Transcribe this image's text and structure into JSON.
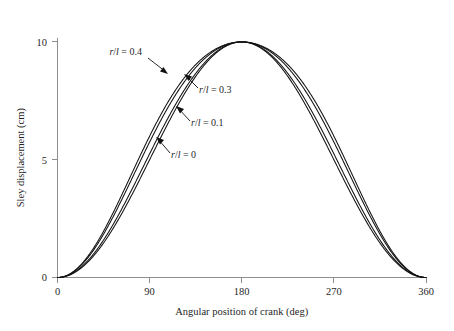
{
  "chart_data": {
    "type": "line",
    "title": "",
    "xlabel": "Angular position of crank (deg)",
    "ylabel": "Sley displacement (cm)",
    "xlim": [
      0,
      360
    ],
    "ylim": [
      0,
      10.6
    ],
    "xticks": [
      0,
      90,
      180,
      270,
      360
    ],
    "xtick_labels": [
      "0",
      "90",
      "180",
      "270",
      "360"
    ],
    "yticks": [
      0,
      5,
      10
    ],
    "ytick_labels": [
      "0",
      "5",
      "10"
    ],
    "grid": false,
    "legend_position": "inline-annotations",
    "x": [
      0,
      10,
      20,
      30,
      40,
      50,
      60,
      70,
      80,
      90,
      100,
      110,
      120,
      130,
      140,
      150,
      160,
      170,
      180,
      190,
      200,
      210,
      220,
      230,
      240,
      250,
      260,
      270,
      280,
      290,
      300,
      310,
      320,
      330,
      340,
      350,
      360
    ],
    "series": [
      {
        "name": "r/l = 0",
        "label_parts": {
          "r": "r",
          "slash": "/",
          "l": "l",
          "eq": " = ",
          "value": "0"
        },
        "ratio": 0,
        "values": [
          0.0,
          0.08,
          0.3,
          0.67,
          1.17,
          1.79,
          2.5,
          3.29,
          4.13,
          5.0,
          5.87,
          6.71,
          7.5,
          8.21,
          8.83,
          9.33,
          9.7,
          9.92,
          10.0,
          9.92,
          9.7,
          9.33,
          8.83,
          8.21,
          7.5,
          6.71,
          5.87,
          5.0,
          4.13,
          3.29,
          2.5,
          1.79,
          1.17,
          0.67,
          0.3,
          0.08,
          0.0
        ]
      },
      {
        "name": "r/l = 0.1",
        "label_parts": {
          "r": "r",
          "slash": "/",
          "l": "l",
          "eq": " = ",
          "value": "0.1"
        },
        "ratio": 0.1,
        "values": [
          0.0,
          0.09,
          0.33,
          0.73,
          1.27,
          1.93,
          2.68,
          3.5,
          4.37,
          5.24,
          6.1,
          6.92,
          7.68,
          8.36,
          8.95,
          9.42,
          9.75,
          9.94,
          10.0,
          9.94,
          9.75,
          9.42,
          8.95,
          8.36,
          7.68,
          6.92,
          6.1,
          5.24,
          4.37,
          3.5,
          2.68,
          1.93,
          1.27,
          0.73,
          0.33,
          0.09,
          0.0
        ]
      },
      {
        "name": "r/l = 0.3",
        "label_parts": {
          "r": "r",
          "slash": "/",
          "l": "l",
          "eq": " = ",
          "value": "0.3"
        },
        "ratio": 0.3,
        "values": [
          0.0,
          0.11,
          0.39,
          0.87,
          1.52,
          2.3,
          3.18,
          4.12,
          5.08,
          6.02,
          6.92,
          7.74,
          8.46,
          9.06,
          9.52,
          9.84,
          10.0,
          10.03,
          10.0,
          9.86,
          9.58,
          9.19,
          8.68,
          8.07,
          7.36,
          6.58,
          5.75,
          4.88,
          4.0,
          3.14,
          2.33,
          1.61,
          1.0,
          0.52,
          0.19,
          0.04,
          0.0
        ]
      },
      {
        "name": "r/l = 0.4",
        "label_parts": {
          "r": "r",
          "slash": "/",
          "l": "l",
          "eq": " = ",
          "value": "0.4"
        },
        "ratio": 0.4,
        "values": [
          0.0,
          0.12,
          0.43,
          0.95,
          1.65,
          2.48,
          3.41,
          4.4,
          5.4,
          6.36,
          7.26,
          8.07,
          8.76,
          9.32,
          9.72,
          9.96,
          10.06,
          10.05,
          10.0,
          9.85,
          9.57,
          9.17,
          8.65,
          8.03,
          7.31,
          6.52,
          5.67,
          4.8,
          3.92,
          3.06,
          2.26,
          1.55,
          0.96,
          0.49,
          0.18,
          0.04,
          0.0
        ]
      }
    ],
    "annotations": [
      {
        "text": "r/l = 0.4",
        "label_x": 142,
        "label_y": 55,
        "arrow_from_x": 158,
        "arrow_from_y": 58,
        "arrow_to_x": 168,
        "arrow_to_y": 73
      },
      {
        "text": "r/l = 0.3",
        "label_x": 196,
        "label_y": 91,
        "arrow_from_x": 194,
        "arrow_from_y": 87,
        "arrow_to_x": 184,
        "arrow_to_y": 75
      },
      {
        "text": "r/l = 0.1",
        "label_x": 188,
        "label_y": 124,
        "arrow_from_x": 186,
        "arrow_from_y": 120,
        "arrow_to_x": 176,
        "arrow_to_y": 106
      },
      {
        "text": "r/l = 0",
        "label_x": 168,
        "label_y": 156,
        "arrow_from_x": 166,
        "arrow_from_y": 152,
        "arrow_to_x": 156,
        "arrow_to_y": 136
      }
    ]
  },
  "axes": {
    "x_axis_title": "Angular position of crank (deg)",
    "y_axis_title": "Sley displacement (cm)"
  }
}
